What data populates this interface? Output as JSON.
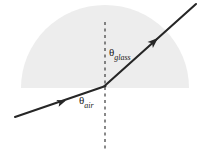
{
  "figure": {
    "name": "refraction-of-light-at-air-glass-interface",
    "background_color": "#ffffff",
    "width": 200,
    "height": 151
  },
  "medium": {
    "name": "glass-semicircle",
    "shape": "semicircle-dome",
    "fill_color": "#ededed",
    "center_x": 105,
    "center_y": 88,
    "radius_x": 84,
    "radius_y": 83
  },
  "normal_line": {
    "name": "normal-dashed-line",
    "style": "dashed",
    "color": "#3a3a3a",
    "x": 105,
    "y_top": 22,
    "y_bottom": 149
  },
  "ray": {
    "color": "#262626",
    "incident": {
      "label": "incident-ray",
      "x1": 15,
      "y1": 117,
      "x2": 105,
      "y2": 86
    },
    "refracted": {
      "label": "refracted-ray",
      "x1": 105,
      "y1": 86,
      "x2": 196,
      "y2": 4
    },
    "arrowheads": [
      {
        "name": "incident-arrowhead",
        "x": 66,
        "y": 100,
        "angle_deg": -19
      },
      {
        "name": "refracted-arrowhead",
        "x": 157,
        "y": 39,
        "angle_deg": -42
      }
    ]
  },
  "labels": {
    "theta_glass": {
      "symbol": "θ",
      "subscript": "glass",
      "full_text": "θglass"
    },
    "theta_air": {
      "symbol": "θ",
      "subscript": "air",
      "full_text": "θair"
    }
  }
}
